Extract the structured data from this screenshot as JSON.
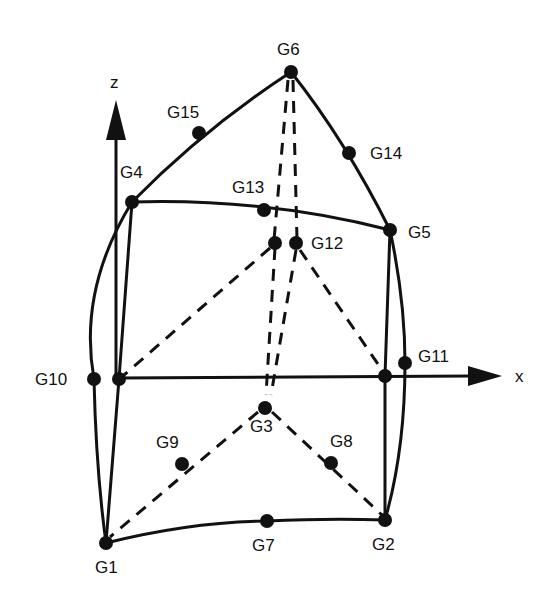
{
  "diagram": {
    "type": "finite-element-node-diagram",
    "axes": {
      "z_label": "z",
      "x_label": "x"
    },
    "nodes": [
      {
        "id": "G1",
        "label": "G1"
      },
      {
        "id": "G2",
        "label": "G2"
      },
      {
        "id": "G3",
        "label": "G3"
      },
      {
        "id": "G4",
        "label": "G4"
      },
      {
        "id": "G5",
        "label": "G5"
      },
      {
        "id": "G6",
        "label": "G6"
      },
      {
        "id": "G7",
        "label": "G7"
      },
      {
        "id": "G8",
        "label": "G8"
      },
      {
        "id": "G9",
        "label": "G9"
      },
      {
        "id": "G10",
        "label": "G10"
      },
      {
        "id": "G11",
        "label": "G11"
      },
      {
        "id": "G12",
        "label": "G12"
      },
      {
        "id": "G13",
        "label": "G13"
      },
      {
        "id": "G14",
        "label": "G14"
      },
      {
        "id": "G15",
        "label": "G15"
      }
    ],
    "colors": {
      "ink": "#111111",
      "background": "#ffffff"
    }
  }
}
